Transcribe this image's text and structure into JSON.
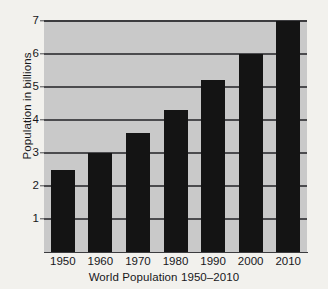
{
  "chart_data": {
    "type": "bar",
    "title": "World Population 1950–2010",
    "xlabel": "World Population 1950–2010",
    "ylabel": "Population in billions",
    "categories": [
      "1950",
      "1960",
      "1970",
      "1980",
      "1990",
      "2000",
      "2010"
    ],
    "values": [
      2.5,
      3.0,
      3.6,
      4.3,
      5.2,
      6.0,
      7.0
    ],
    "ylim": [
      0,
      7
    ],
    "y_ticks": [
      1,
      2,
      3,
      4,
      5,
      6,
      7
    ],
    "y_tick_labels": [
      "1",
      "2",
      "3",
      "4",
      "5",
      "6",
      "7"
    ],
    "grid": true,
    "legend": false,
    "bar_color": "#141414",
    "plot_background": "#c9c9c9",
    "grid_color": "#4b4b4e",
    "page_background": "#f2f1ed"
  }
}
